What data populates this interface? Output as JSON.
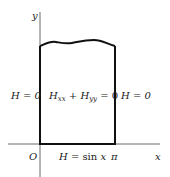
{
  "diagram": {
    "axes": {
      "x_label": "x",
      "y_label": "y",
      "origin_label": "O",
      "x_tick_label": "π"
    },
    "region": {
      "shape": "semi-infinite strip, wavy top edge indicating continuation",
      "interior_equation": {
        "H": "H",
        "xx": "xx",
        "plus": "+",
        "H2": "H",
        "yy": "yy",
        "rhs": "= 0"
      },
      "left_boundary": "H = 0",
      "right_boundary": "H = 0",
      "bottom_boundary": {
        "lhs": "H = ",
        "fn": "sin",
        "var": " x"
      }
    },
    "colors": {
      "line": "#111111",
      "text": "#222222",
      "axis": "#444444"
    }
  }
}
